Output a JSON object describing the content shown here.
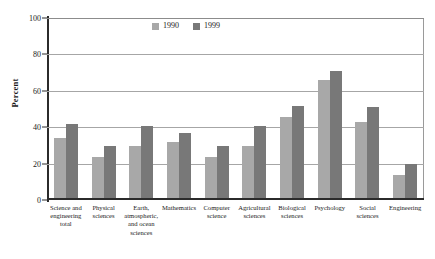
{
  "chart_data": {
    "type": "bar",
    "title": "",
    "xlabel": "",
    "ylabel": "Percent",
    "ylim": [
      0,
      100
    ],
    "yticks": [
      0,
      20,
      40,
      60,
      80,
      100
    ],
    "grid": true,
    "legend_position": "top-center",
    "categories": [
      "Science and engineering total",
      "Physical sciences",
      "Earth, atmospheric, and ocean sciences",
      "Mathematics",
      "Computer science",
      "Agricultural sciences",
      "Biological sciences",
      "Psychology",
      "Social sciences",
      "Engineering"
    ],
    "category_lines": [
      [
        "Science and",
        "engineering",
        "total"
      ],
      [
        "Physical",
        "sciences"
      ],
      [
        "Earth,",
        "atmospheric,",
        "and ocean",
        "sciences"
      ],
      [
        "Mathematics"
      ],
      [
        "Computer",
        "science"
      ],
      [
        "Agricultural",
        "sciences"
      ],
      [
        "Biological",
        "sciences"
      ],
      [
        "Psychology"
      ],
      [
        "Social",
        "sciences"
      ],
      [
        "Engineering"
      ]
    ],
    "series": [
      {
        "name": "1990",
        "color": "#a8a8a8",
        "values": [
          33,
          23,
          29,
          31,
          23,
          29,
          45,
          65,
          42,
          13
        ]
      },
      {
        "name": "1999",
        "color": "#787878",
        "values": [
          41,
          29,
          40,
          36,
          29,
          40,
          51,
          70,
          50,
          19
        ]
      }
    ]
  }
}
